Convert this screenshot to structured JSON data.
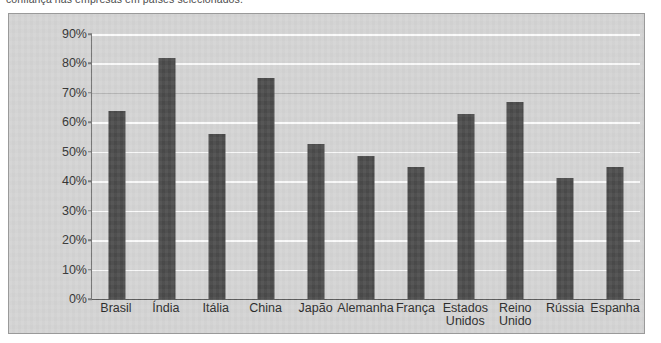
{
  "caption": "confiança nas empresas em países selecionados.",
  "colors": {
    "bar": "#4b4b4b",
    "plot_background": "#d4d4d4",
    "gridline": "#fbfbfb",
    "frame_border": "#9a9a9a",
    "axis": "#555555",
    "text": "#2b2b2b"
  },
  "chart_data": {
    "type": "bar",
    "title": "",
    "subtitle": "",
    "xlabel": "",
    "ylabel": "",
    "ylim": [
      0,
      90
    ],
    "grid": true,
    "legend": false,
    "legend_position": "none",
    "y_ticks": [
      "0%",
      "10%",
      "20%",
      "30%",
      "40%",
      "50%",
      "60%",
      "70%",
      "80%",
      "90%"
    ],
    "y_tick_values": [
      0,
      10,
      20,
      30,
      40,
      50,
      60,
      70,
      80,
      90
    ],
    "categories": [
      "Brasil",
      "Índia",
      "Itália",
      "China",
      "Japão",
      "Alemanha",
      "França",
      "Estados\nUnidos",
      "Reino\nUnido",
      "Rússia",
      "Espanha"
    ],
    "values": [
      64,
      82,
      56,
      75,
      52.5,
      48.5,
      45,
      63,
      67,
      41,
      45
    ],
    "value_labels": [
      "64%",
      "82%",
      "56%",
      "75%",
      "53%",
      "49%",
      "45%",
      "63%",
      "67%",
      "41%",
      "45%"
    ]
  }
}
